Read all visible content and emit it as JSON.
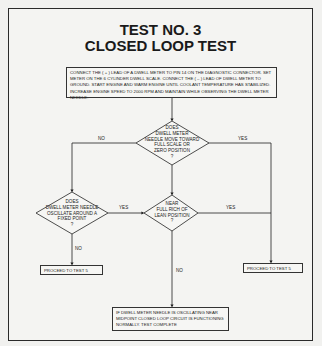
{
  "title": {
    "line1": "TEST NO. 3",
    "line2": "CLOSED LOOP TEST"
  },
  "start_box": {
    "text": "CONNECT THE ( + ) LEAD OF A DWELL METER TO PIN 14 ON THE DIAGNOSTIC CONNECTOR. SET METER ON THE 6 CYLINDER DWELL SCALE. CONNECT THE ( – ) LEAD OF DWELL METER TO GROUND. START ENGINE AND WARM ENGINE UNTIL COOLANT TEMPERATURE HAS STABILIZED. INCREASE ENGINE SPEED TO 2000 RPM AND MAINTAIN WHILE OBSERVING THE DWELL METER NEEDLE."
  },
  "decisions": [
    {
      "id": "d1",
      "lines": [
        "DOES",
        "DWELL METER",
        "NEEDLE MOVE TOWARD",
        "FULL SCALE OR",
        "ZERO POSITION",
        "?"
      ]
    },
    {
      "id": "d2",
      "lines": [
        "DOES",
        "DWELL METER NEEDLE",
        "OSCILLATE AROUND A",
        "FIXED POINT",
        "?"
      ]
    },
    {
      "id": "d3",
      "lines": [
        "NEAR",
        "FULL RICH OF",
        "LEAN POSITION",
        "?"
      ]
    }
  ],
  "edge_labels": {
    "d1_no": "NO",
    "d1_yes": "YES",
    "d2_yes": "YES",
    "d2_no": "NO",
    "d3_yes": "YES",
    "d3_no": "NO"
  },
  "outcomes": {
    "left_proceed": "PROCEED TO TEST 5",
    "right_proceed": "PROCEED TO TEST 5",
    "final": "IF DWELL METER NEEDLE IS OSCILLATING NEAR MIDPOINT CLOSED LOOP CIRCUIT IS FUNCTIONING NORMALLY. TEST COMPLETE"
  }
}
